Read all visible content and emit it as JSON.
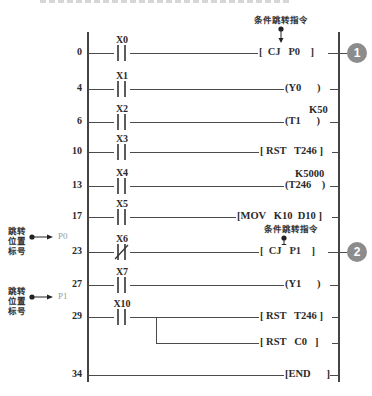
{
  "caption_cut_off": "",
  "annotation_top": "条件跳转指令",
  "annotation_mid": "条件跳转指令",
  "jump_label_text": [
    "跳转",
    "位置",
    "标号"
  ],
  "badges": [
    "1",
    "2"
  ],
  "rungs": [
    {
      "step": "0",
      "contact": "X0",
      "type": "NO",
      "instruction": "[  CJ   P0    ]",
      "y": 53
    },
    {
      "step": "4",
      "contact": "X1",
      "type": "NO",
      "instruction": "(Y0      )",
      "y": 89
    },
    {
      "step": "6",
      "contact": "X2",
      "type": "NO",
      "instruction": "(T1      )",
      "setting": "K50",
      "y": 122
    },
    {
      "step": "10",
      "contact": "X3",
      "type": "NO",
      "instruction": "[ RST   T246 ]",
      "y": 152
    },
    {
      "step": "13",
      "contact": "X4",
      "type": "NO",
      "instruction": "(T246    )",
      "setting": "K5000",
      "y": 186
    },
    {
      "step": "17",
      "contact": "X5",
      "type": "NO",
      "instruction": "[MOV   K10  D10 ]",
      "y": 217
    },
    {
      "step": "23",
      "contact": "X6",
      "type": "NC",
      "instruction": "[  CJ   P1    ]",
      "y": 252
    },
    {
      "step": "27",
      "contact": "X7",
      "type": "NO",
      "instruction": "(Y1      )",
      "y": 285
    },
    {
      "step": "29",
      "contact": "X10",
      "type": "NO",
      "instruction": "[ RST   T246 ]",
      "branch_instruction": "[ RST   C0   ]",
      "y": 317
    },
    {
      "step": "34",
      "contact": "",
      "type": "none",
      "instruction": "[END      ]",
      "y": 375
    }
  ],
  "pointers": [
    {
      "label": "P0",
      "y": 237
    },
    {
      "label": "P1",
      "y": 297
    }
  ],
  "colors": {
    "line": "#4a4a4a",
    "badge": "#8c8c8c"
  }
}
